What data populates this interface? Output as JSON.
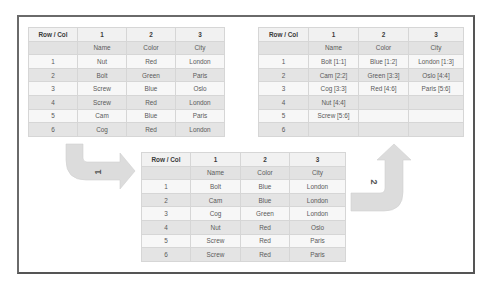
{
  "header_row": [
    "Row / Col",
    "1",
    "2",
    "3"
  ],
  "field_names": [
    "",
    "Name",
    "Color",
    "City"
  ],
  "tables": {
    "original": {
      "rows": [
        [
          "1",
          "Nut",
          "Red",
          "London"
        ],
        [
          "2",
          "Bolt",
          "Green",
          "Paris"
        ],
        [
          "3",
          "Screw",
          "Blue",
          "Oslo"
        ],
        [
          "4",
          "Screw",
          "Red",
          "London"
        ],
        [
          "5",
          "Cam",
          "Blue",
          "Paris"
        ],
        [
          "6",
          "Cog",
          "Red",
          "London"
        ]
      ]
    },
    "sorted": {
      "rows": [
        [
          "1",
          "Bolt",
          "Blue",
          "London"
        ],
        [
          "2",
          "Cam",
          "Blue",
          "London"
        ],
        [
          "3",
          "Cog",
          "Green",
          "London"
        ],
        [
          "4",
          "Nut",
          "Red",
          "Oslo"
        ],
        [
          "5",
          "Screw",
          "Red",
          "Paris"
        ],
        [
          "6",
          "Screw",
          "Red",
          "Paris"
        ]
      ]
    },
    "compressed": {
      "rows": [
        [
          "1",
          "Bolt [1:1]",
          "Blue [1:2]",
          "London [1:3]"
        ],
        [
          "2",
          "Cam [2:2]",
          "Green [3:3]",
          "Oslo [4:4]"
        ],
        [
          "3",
          "Cog [3:3]",
          "Red [4:6]",
          "Paris [5:6]"
        ],
        [
          "4",
          "Nut [4:4]",
          "",
          ""
        ],
        [
          "5",
          "Screw [5:6]",
          "",
          ""
        ],
        [
          "6",
          "",
          "",
          ""
        ]
      ]
    }
  },
  "arrows": {
    "step1_label": "1",
    "step2_label": "2",
    "color": "#dcdcdc"
  },
  "colors": {
    "frame_border": "#555555",
    "grid_line": "#d6d6d6",
    "header_bg": "#f1f1f1",
    "names_bg": "#e2e2e2",
    "odd_bg": "#f7f7f7",
    "even_bg": "#e4e4e4"
  }
}
